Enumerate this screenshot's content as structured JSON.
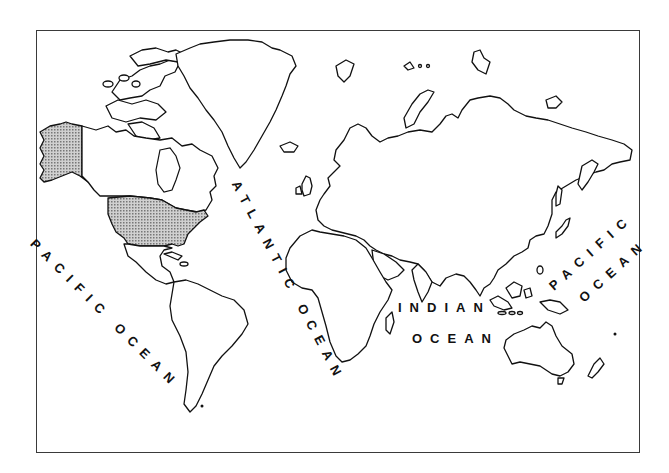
{
  "figure": {
    "type": "world outline map",
    "highlighted_regions": [
      "United States (contiguous)",
      "Alaska"
    ],
    "highlight_style": "stippled gray fill",
    "colors": {
      "outline": "#111111",
      "background": "#ffffff",
      "stipple": "#9a9a9a",
      "frame": "#3a3a3a"
    }
  },
  "labels": {
    "pacific_west": "PACIFIC OCEAN",
    "atlantic": "ATLANTIC OCEAN",
    "indian_line1": "INDIAN",
    "indian_line2": "OCEAN",
    "pacific_east_line1": "PACIFIC",
    "pacific_east_line2": "OCEAN"
  }
}
